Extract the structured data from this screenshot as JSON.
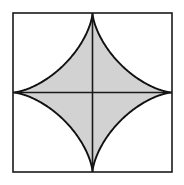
{
  "figure": {
    "canvas": {
      "width": 184,
      "height": 185,
      "background": "#ffffff"
    },
    "square": {
      "label": "bounding-square",
      "x": 13,
      "y": 13,
      "width": 159,
      "height": 159,
      "stroke": "#1a1a1a",
      "stroke_width": 1.6,
      "fill": "none"
    },
    "axes": {
      "label": "center-cross",
      "stroke": "#1a1a1a",
      "stroke_width": 1.6,
      "horizontal": {
        "x1": 13,
        "y1": 92.5,
        "x2": 172,
        "y2": 92.5
      },
      "vertical": {
        "x1": 92.5,
        "y1": 13,
        "x2": 92.5,
        "y2": 172
      }
    },
    "astroid": {
      "label": "astroid-star",
      "fill": "#d2d2d2",
      "stroke": "#111111",
      "stroke_width": 1.9,
      "center": {
        "x": 92.5,
        "y": 92.5
      },
      "radius": 79.5,
      "cusps": [
        {
          "name": "top",
          "x": 92.5,
          "y": 13.0
        },
        {
          "name": "right",
          "x": 172.0,
          "y": 92.5
        },
        {
          "name": "bottom",
          "x": 92.5,
          "y": 172.0
        },
        {
          "name": "left",
          "x": 13.0,
          "y": 92.5
        }
      ],
      "path": "M 92.5 13 C 92.5 48.8 57.3 92.5 13 92.5 C 57.3 92.5 92.5 136.2 92.5 172 C 92.5 136.2 127.7 92.5 172 92.5 C 127.7 92.5 92.5 48.8 92.5 13 Z"
    }
  },
  "chart_data": {
    "type": "diagram",
    "shapes": [
      {
        "name": "square",
        "kind": "rect",
        "x": 13,
        "y": 13,
        "side": 159,
        "fill": "none",
        "stroke": "#1a1a1a"
      },
      {
        "name": "astroid",
        "kind": "astroid",
        "cx": 92.5,
        "cy": 92.5,
        "r": 79.5,
        "fill": "#d2d2d2",
        "stroke": "#111111"
      },
      {
        "name": "horizontal-axis",
        "kind": "line",
        "x1": 13,
        "y1": 92.5,
        "x2": 172,
        "y2": 92.5,
        "stroke": "#1a1a1a"
      },
      {
        "name": "vertical-axis",
        "kind": "line",
        "x1": 92.5,
        "y1": 13,
        "x2": 92.5,
        "y2": 172,
        "stroke": "#1a1a1a"
      }
    ],
    "xlim": [
      13,
      172
    ],
    "ylim": [
      13,
      172
    ],
    "grid": false,
    "legend": false,
    "labels": []
  }
}
